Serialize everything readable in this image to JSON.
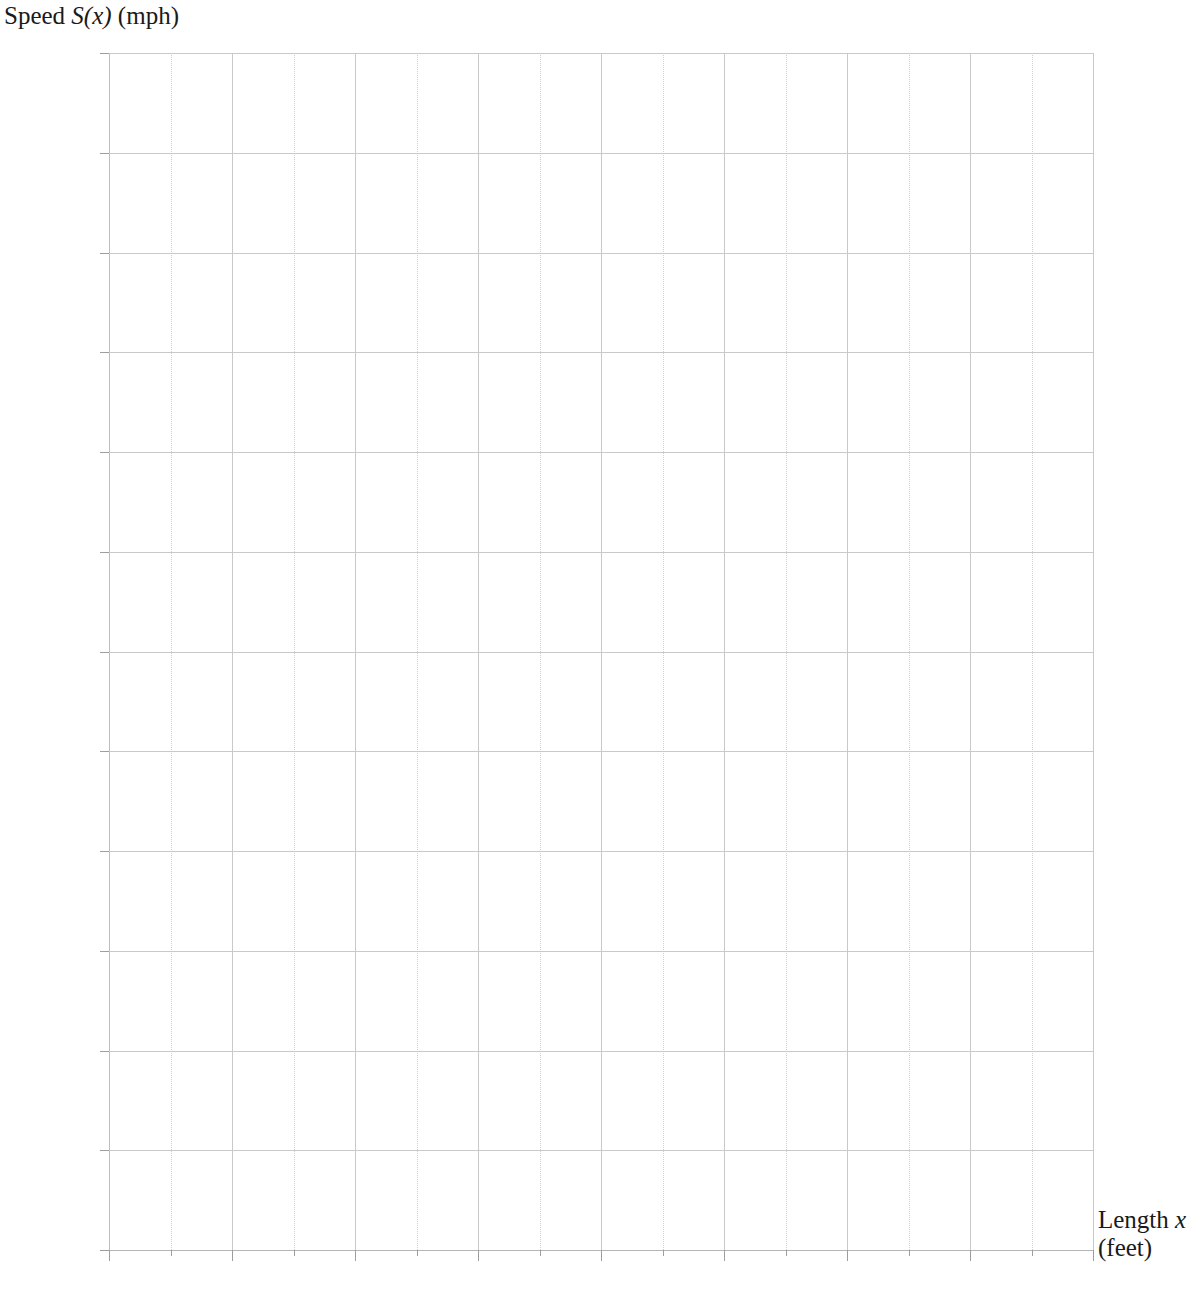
{
  "chart_data": {
    "type": "line",
    "title": "",
    "subtitle": "",
    "ylabel_parts": {
      "prefix": "Speed ",
      "variable": "S(x)",
      "suffix": " (mph)"
    },
    "xlabel_parts": {
      "prefix": "Length ",
      "variable": "x",
      "suffix": "(feet)"
    },
    "ylabel": "Speed S(x) (mph)",
    "xlabel": "Length x (feet)",
    "xlim": [
      0,
      400
    ],
    "ylim": [
      0,
      120
    ],
    "x_major_ticks": [
      0,
      50,
      100,
      150,
      200,
      250,
      300,
      350,
      400
    ],
    "x_minor_ticks": [
      25,
      75,
      125,
      175,
      225,
      275,
      325,
      375
    ],
    "x_tick_labels": [
      "0",
      "50",
      "100",
      "150",
      "200",
      "250",
      "300",
      "350",
      "400"
    ],
    "y_major_ticks": [
      0,
      10,
      20,
      30,
      40,
      50,
      60,
      70,
      80,
      90,
      100,
      110,
      120
    ],
    "y_tick_labels": [
      "0",
      "10",
      "20",
      "30",
      "40",
      "50",
      "60",
      "70",
      "80",
      "90",
      "100",
      "110",
      "120"
    ],
    "grid": true,
    "grid_x_step": 25,
    "grid_y_step": 10,
    "legend": null,
    "series": [],
    "annotations": [],
    "gridline_color": "#c9c9c9",
    "minor_gridline_color": "#cfcfcf",
    "axis_color": "#b5b5b5",
    "text_color": "#262626",
    "background_color": "#ffffff"
  }
}
